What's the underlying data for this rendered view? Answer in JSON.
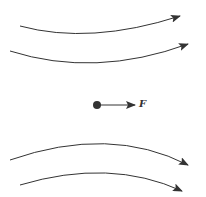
{
  "diagram": {
    "force_label": "F",
    "line_color": "#333333",
    "field_lines": [
      {
        "id": "top-1",
        "path": "M20,26 Q90,45 176,17",
        "direction": "right-up"
      },
      {
        "id": "top-2",
        "path": "M10,51 Q95,78 184,45",
        "direction": "right-up"
      },
      {
        "id": "bottom-1",
        "path": "M10,160 Q110,125 184,164",
        "direction": "right-down"
      },
      {
        "id": "bottom-2",
        "path": "M20,185 Q110,158 178,190",
        "direction": "right-down"
      }
    ]
  }
}
